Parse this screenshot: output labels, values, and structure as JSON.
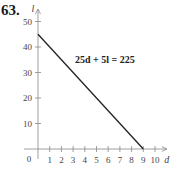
{
  "problem_number": "63.",
  "chart_data": {
    "type": "line",
    "title": "",
    "xlabel": "d",
    "ylabel": "l",
    "equation_label": "25d + 5l = 225",
    "x_ticks": [
      1,
      2,
      3,
      4,
      5,
      6,
      7,
      8,
      9,
      10
    ],
    "y_ticks": [
      10,
      20,
      30,
      40,
      50
    ],
    "origin_label": "0",
    "xlim": [
      0,
      10.5
    ],
    "ylim": [
      0,
      55
    ],
    "grid": false,
    "series": [
      {
        "name": "25d + 5l = 225",
        "x": [
          0,
          9
        ],
        "y": [
          45,
          0
        ],
        "color": "#222222"
      }
    ]
  }
}
